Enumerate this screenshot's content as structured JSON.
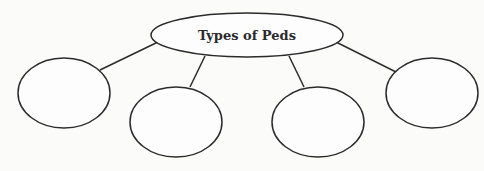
{
  "diagram": {
    "type": "concept-map",
    "title": "Types of Peds",
    "center_node": {
      "label": "Types of Peds",
      "cx": 247,
      "cy": 35,
      "rx": 96,
      "ry": 22
    },
    "child_nodes": [
      {
        "label": "",
        "cx": 64,
        "cy": 93,
        "rx": 46,
        "ry": 35
      },
      {
        "label": "",
        "cx": 176,
        "cy": 122,
        "rx": 46,
        "ry": 35
      },
      {
        "label": "",
        "cx": 318,
        "cy": 122,
        "rx": 46,
        "ry": 35
      },
      {
        "label": "",
        "cx": 432,
        "cy": 93,
        "rx": 46,
        "ry": 35
      }
    ],
    "colors": {
      "stroke": "#2b2b2b",
      "background": "#fbfbfa",
      "text": "#2a2a2a"
    }
  }
}
